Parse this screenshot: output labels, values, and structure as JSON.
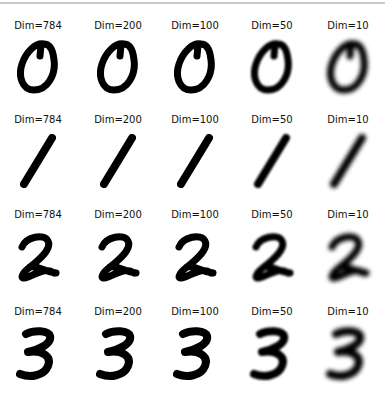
{
  "figure": {
    "columns": [
      "Dim=784",
      "Dim=200",
      "Dim=100",
      "Dim=50",
      "Dim=10"
    ],
    "rows": [
      {
        "digit": "0",
        "titles": [
          "Dim=784",
          "Dim=200",
          "Dim=100",
          "Dim=50",
          "Dim=10"
        ]
      },
      {
        "digit": "1",
        "titles": [
          "Dim=784",
          "Dim=200",
          "Dim=100",
          "Dim=50",
          "Dim=10"
        ]
      },
      {
        "digit": "2",
        "titles": [
          "Dim=784",
          "Dim=200",
          "Dim=100",
          "Dim=50",
          "Dim=10"
        ]
      },
      {
        "digit": "3",
        "titles": [
          "Dim=784",
          "Dim=200",
          "Dim=100",
          "Dim=50",
          "Dim=10"
        ]
      }
    ],
    "blur_levels": [
      0,
      0.3,
      0.6,
      1.0,
      2.2
    ],
    "ink_color": "#000000",
    "background_color": "#ffffff"
  }
}
